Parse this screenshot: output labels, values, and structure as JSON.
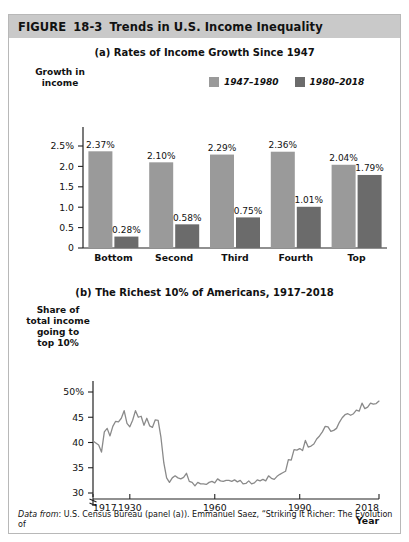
{
  "figure": {
    "label": "FIGURE",
    "number": "18-3",
    "title": "Trends in U.S. Income Inequality"
  },
  "source_note": {
    "prefix": "Data from",
    "text": ": U.S. Census Bureau (panel (a)). Emmanuel Saez, “Striking It Richer: The Evolution of"
  },
  "colors": {
    "series_light": "#9a9a9a",
    "series_dark": "#6b6b6b",
    "header_bg": "#c9c9c9",
    "axis": "#222222",
    "line": "#8a8a8a"
  },
  "panel_a": {
    "title": "(a) Rates of Income Growth Since 1947",
    "ylabel": "Growth in income",
    "ylabel_lines": [
      "Growth in",
      "income"
    ],
    "xlabel": "Income group (quintile)",
    "legend": [
      {
        "label": "1947–1980",
        "color": "#9a9a9a"
      },
      {
        "label": "1980–2018",
        "color": "#6b6b6b"
      }
    ],
    "yticks": [
      "2.5%",
      "2.0",
      "1.5",
      "1.0",
      "0.5",
      "0"
    ]
  },
  "panel_b": {
    "title": "(b) The Richest 10% of Americans, 1917–2018",
    "ylabel": "Share of total income going to top 10%",
    "ylabel_lines": [
      "Share of",
      "total income",
      "going to",
      "top 10%"
    ],
    "xlabel": "Year",
    "yticks": [
      "50%",
      "45",
      "40",
      "35",
      "30"
    ],
    "xticks": [
      "1917",
      "1930",
      "1960",
      "1990",
      "2018"
    ]
  },
  "chart_data": [
    {
      "type": "bar",
      "title": "(a) Rates of Income Growth Since 1947",
      "xlabel": "Income group (quintile)",
      "ylabel": "Growth in income",
      "categories": [
        "Bottom",
        "Second",
        "Third",
        "Fourth",
        "Top"
      ],
      "ylim": [
        0,
        2.5
      ],
      "yticks": [
        0,
        0.5,
        1.0,
        1.5,
        2.0,
        2.5
      ],
      "grid": false,
      "legend_position": "top-right",
      "series": [
        {
          "name": "1947–1980",
          "color": "#9a9a9a",
          "values": [
            2.37,
            2.1,
            2.29,
            2.36,
            2.04
          ],
          "labels": [
            "2.37%",
            "2.10%",
            "2.29%",
            "2.36%",
            "2.04%"
          ]
        },
        {
          "name": "1980–2018",
          "color": "#6b6b6b",
          "values": [
            0.28,
            0.58,
            0.75,
            1.01,
            1.79
          ],
          "labels": [
            "0.28%",
            "0.58%",
            "0.75%",
            "1.01%",
            "1.79%"
          ]
        }
      ]
    },
    {
      "type": "line",
      "title": "(b) The Richest 10% of Americans, 1917–2018",
      "xlabel": "Year",
      "ylabel": "Share of total income going to top 10%",
      "xlim": [
        1917,
        2018
      ],
      "ylim": [
        28,
        52
      ],
      "yticks": [
        30,
        35,
        40,
        45,
        50
      ],
      "xticks": [
        1917,
        1930,
        1960,
        1990,
        2018
      ],
      "grid": false,
      "axis_break_y": true,
      "series": [
        {
          "name": "Share of total income going to top 10%",
          "color": "#8a8a8a",
          "x": [
            1917,
            1918,
            1919,
            1920,
            1921,
            1922,
            1923,
            1924,
            1925,
            1926,
            1927,
            1928,
            1929,
            1930,
            1931,
            1932,
            1933,
            1934,
            1935,
            1936,
            1937,
            1938,
            1939,
            1940,
            1941,
            1942,
            1943,
            1944,
            1945,
            1946,
            1947,
            1948,
            1949,
            1950,
            1951,
            1952,
            1953,
            1954,
            1955,
            1956,
            1957,
            1958,
            1959,
            1960,
            1961,
            1962,
            1963,
            1964,
            1965,
            1966,
            1967,
            1968,
            1969,
            1970,
            1971,
            1972,
            1973,
            1974,
            1975,
            1976,
            1977,
            1978,
            1979,
            1980,
            1981,
            1982,
            1983,
            1984,
            1985,
            1986,
            1987,
            1988,
            1989,
            1990,
            1991,
            1992,
            1993,
            1994,
            1995,
            1996,
            1997,
            1998,
            1999,
            2000,
            2001,
            2002,
            2003,
            2004,
            2005,
            2006,
            2007,
            2008,
            2009,
            2010,
            2011,
            2012,
            2013,
            2014,
            2015,
            2016,
            2017,
            2018
          ],
          "y": [
            40.3,
            39.9,
            39.5,
            38.1,
            42.1,
            42.8,
            41.3,
            43.2,
            44.2,
            44.1,
            44.8,
            46.3,
            43.8,
            43.1,
            44.4,
            46.3,
            45.0,
            45.2,
            43.4,
            44.8,
            43.3,
            43.0,
            44.5,
            44.4,
            41.0,
            36.0,
            33.0,
            32.1,
            33.0,
            33.4,
            33.0,
            32.8,
            33.1,
            33.9,
            32.3,
            32.1,
            31.4,
            32.1,
            31.8,
            31.8,
            31.7,
            32.1,
            32.3,
            32.0,
            32.8,
            32.4,
            32.3,
            32.5,
            32.5,
            32.3,
            32.6,
            32.2,
            32.5,
            31.8,
            31.9,
            32.4,
            31.8,
            32.0,
            32.6,
            32.4,
            32.7,
            32.4,
            33.4,
            32.9,
            32.7,
            33.3,
            33.7,
            34.0,
            34.3,
            36.6,
            36.5,
            38.6,
            38.5,
            38.8,
            38.4,
            40.4,
            39.1,
            39.3,
            39.7,
            40.7,
            41.3,
            42.1,
            43.2,
            43.1,
            42.2,
            42.4,
            42.8,
            44.0,
            44.9,
            45.5,
            45.7,
            45.4,
            45.7,
            46.4,
            46.2,
            47.8,
            46.7,
            47.0,
            47.8,
            47.6,
            47.7,
            48.2
          ]
        }
      ]
    }
  ]
}
